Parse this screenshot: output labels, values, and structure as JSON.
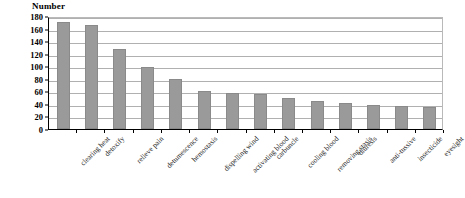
{
  "chart_data": {
    "type": "bar",
    "title": "",
    "ylabel": "Number",
    "xlabel": "",
    "ylim": [
      0,
      180
    ],
    "ytick_step": 20,
    "yticks": [
      0,
      20,
      40,
      60,
      80,
      100,
      120,
      140,
      160,
      180
    ],
    "grid": true,
    "legend": "none",
    "bar_color": "#9a9a9a",
    "categories": [
      "clearing heat",
      "detoxify",
      "relieve pain",
      "detumescence",
      "hemostasis",
      "dispelling wind",
      "activating blood",
      "carbuncle",
      "cooling blood",
      "removing stasis",
      "diuresis",
      "anti-tussive",
      "insecticide",
      "eyesight"
    ],
    "values": [
      171,
      165,
      128,
      99,
      79,
      61,
      57,
      55,
      50,
      45,
      42,
      38,
      37,
      35
    ]
  }
}
